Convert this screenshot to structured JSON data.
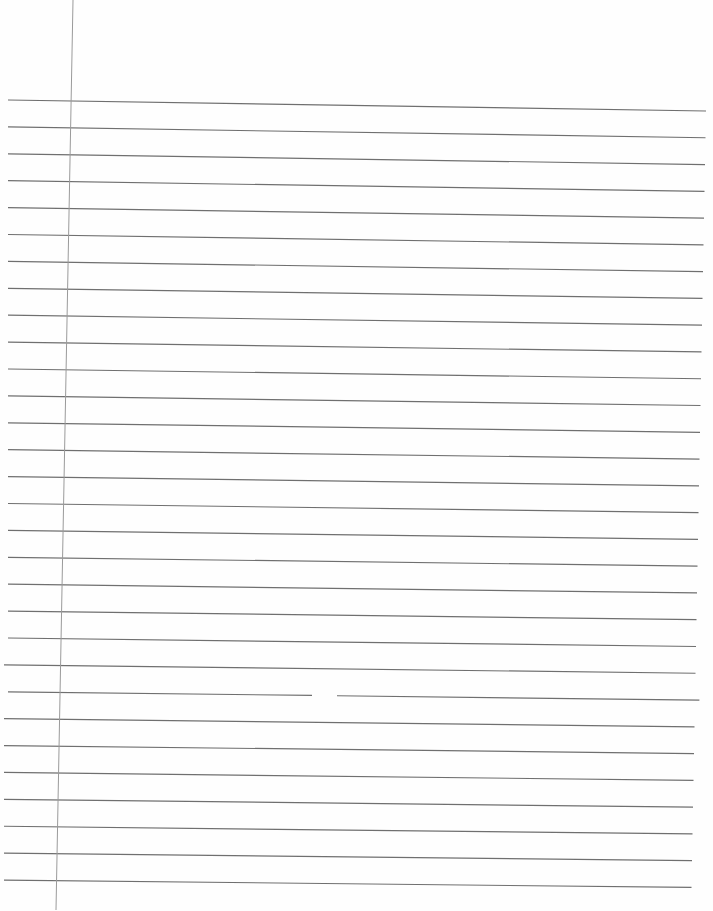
{
  "document": {
    "type": "ruled notebook paper (blank)",
    "text_content": "",
    "background_color": "#fefefe",
    "rule_color": "#6f6f6f",
    "margin_color": "#9a9a9a",
    "rule_count": 30,
    "rule_first_y_left": 100,
    "rule_first_y_right": 111,
    "rule_spacing": 26.9,
    "rule_x_start": 8,
    "rule_x_end": 706,
    "margin_line": {
      "x_top": 73,
      "x_bottom": 56,
      "y_top": 0,
      "y_bottom": 910
    },
    "smudge": {
      "rule_index": 22,
      "gap_x_start": 312,
      "gap_x_end": 337
    }
  }
}
